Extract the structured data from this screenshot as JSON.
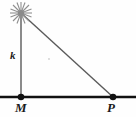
{
  "figure": {
    "background_color": "#fefefe",
    "width": 136,
    "height": 117
  },
  "labels": {
    "height_segment": "k",
    "base_point_left": "M",
    "base_point_right": "P"
  },
  "colors": {
    "ground_line": "#111111",
    "triangle_stroke": "#6e6e6e",
    "hypotenuse_stroke": "#5a5a5a",
    "point_fill": "#111111",
    "star_fill": "#9a9a9a",
    "label_text": "#1a1a1a"
  },
  "geometry": {
    "light_source": {
      "x": 21,
      "y": 13,
      "icon": "star-burst-icon"
    },
    "point_m": {
      "x": 21,
      "y": 97
    },
    "point_p": {
      "x": 113,
      "y": 97
    },
    "ground_line": {
      "x1": 0,
      "y1": 97,
      "x2": 136,
      "y2": 97
    },
    "vertical_segment": {
      "x1": 21,
      "y1": 13,
      "x2": 21,
      "y2": 97
    },
    "hypotenuse_segment": {
      "x1": 21,
      "y1": 13,
      "x2": 113,
      "y2": 97
    }
  }
}
